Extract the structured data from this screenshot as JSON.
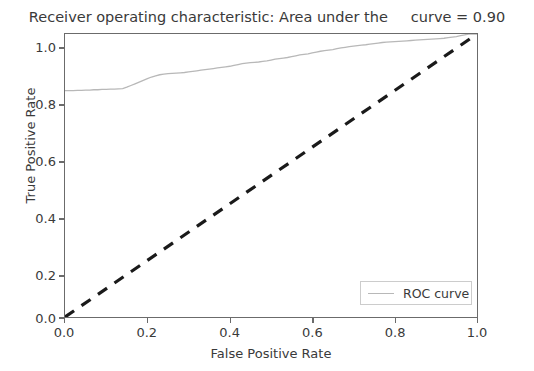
{
  "chart_data": {
    "type": "line",
    "title": "Receiver operating characteristic: Area under the     curve = 0.90",
    "xlabel": "False Positive Rate",
    "ylabel": "True Positive Rate",
    "xlim": [
      0.0,
      1.0
    ],
    "ylim": [
      0.0,
      1.0
    ],
    "grid": false,
    "legend_position": "lower right",
    "x_ticks": [
      "0.0",
      "0.2",
      "0.4",
      "0.6",
      "0.8",
      "1.0"
    ],
    "x_tick_values": [
      0.0,
      0.2,
      0.4,
      0.6,
      0.8,
      1.0
    ],
    "y_ticks": [
      "0.0",
      "0.2",
      "0.4",
      "0.6",
      "0.8",
      "1.0"
    ],
    "y_tick_values": [
      0.0,
      0.2,
      0.4,
      0.6,
      0.8,
      1.0
    ],
    "auc": 0.9,
    "series": [
      {
        "name": "ROC curve",
        "color": "#b8b8b8",
        "linestyle": "solid",
        "linewidth": 1.3,
        "points": [
          [
            0.0,
            0.8
          ],
          [
            0.01,
            0.8
          ],
          [
            0.02,
            0.8
          ],
          [
            0.03,
            0.801
          ],
          [
            0.04,
            0.801
          ],
          [
            0.05,
            0.802
          ],
          [
            0.06,
            0.802
          ],
          [
            0.07,
            0.803
          ],
          [
            0.08,
            0.803
          ],
          [
            0.09,
            0.804
          ],
          [
            0.1,
            0.804
          ],
          [
            0.11,
            0.805
          ],
          [
            0.12,
            0.805
          ],
          [
            0.13,
            0.806
          ],
          [
            0.14,
            0.807
          ],
          [
            0.15,
            0.812
          ],
          [
            0.16,
            0.818
          ],
          [
            0.17,
            0.824
          ],
          [
            0.18,
            0.83
          ],
          [
            0.19,
            0.836
          ],
          [
            0.2,
            0.842
          ],
          [
            0.21,
            0.848
          ],
          [
            0.22,
            0.852
          ],
          [
            0.23,
            0.856
          ],
          [
            0.24,
            0.858
          ],
          [
            0.25,
            0.86
          ],
          [
            0.26,
            0.861
          ],
          [
            0.27,
            0.862
          ],
          [
            0.28,
            0.863
          ],
          [
            0.29,
            0.864
          ],
          [
            0.3,
            0.866
          ],
          [
            0.31,
            0.868
          ],
          [
            0.32,
            0.87
          ],
          [
            0.33,
            0.872
          ],
          [
            0.34,
            0.874
          ],
          [
            0.35,
            0.876
          ],
          [
            0.36,
            0.878
          ],
          [
            0.37,
            0.88
          ],
          [
            0.38,
            0.882
          ],
          [
            0.39,
            0.884
          ],
          [
            0.4,
            0.886
          ],
          [
            0.41,
            0.889
          ],
          [
            0.42,
            0.892
          ],
          [
            0.43,
            0.895
          ],
          [
            0.44,
            0.897
          ],
          [
            0.45,
            0.899
          ],
          [
            0.46,
            0.9
          ],
          [
            0.47,
            0.901
          ],
          [
            0.48,
            0.903
          ],
          [
            0.49,
            0.905
          ],
          [
            0.5,
            0.908
          ],
          [
            0.51,
            0.911
          ],
          [
            0.52,
            0.913
          ],
          [
            0.53,
            0.915
          ],
          [
            0.54,
            0.917
          ],
          [
            0.55,
            0.92
          ],
          [
            0.56,
            0.923
          ],
          [
            0.57,
            0.926
          ],
          [
            0.58,
            0.928
          ],
          [
            0.59,
            0.93
          ],
          [
            0.6,
            0.933
          ],
          [
            0.61,
            0.936
          ],
          [
            0.62,
            0.939
          ],
          [
            0.63,
            0.941
          ],
          [
            0.64,
            0.943
          ],
          [
            0.65,
            0.945
          ],
          [
            0.66,
            0.948
          ],
          [
            0.67,
            0.951
          ],
          [
            0.68,
            0.953
          ],
          [
            0.69,
            0.955
          ],
          [
            0.7,
            0.957
          ],
          [
            0.71,
            0.959
          ],
          [
            0.72,
            0.961
          ],
          [
            0.73,
            0.962
          ],
          [
            0.74,
            0.964
          ],
          [
            0.75,
            0.966
          ],
          [
            0.76,
            0.968
          ],
          [
            0.77,
            0.97
          ],
          [
            0.78,
            0.971
          ],
          [
            0.79,
            0.972
          ],
          [
            0.8,
            0.973
          ],
          [
            0.81,
            0.974
          ],
          [
            0.82,
            0.975
          ],
          [
            0.83,
            0.976
          ],
          [
            0.84,
            0.977
          ],
          [
            0.85,
            0.978
          ],
          [
            0.86,
            0.979
          ],
          [
            0.87,
            0.98
          ],
          [
            0.88,
            0.981
          ],
          [
            0.89,
            0.982
          ],
          [
            0.9,
            0.983
          ],
          [
            0.91,
            0.984
          ],
          [
            0.92,
            0.985
          ],
          [
            0.93,
            0.987
          ],
          [
            0.94,
            0.989
          ],
          [
            0.95,
            0.991
          ],
          [
            0.96,
            0.994
          ],
          [
            0.97,
            0.997
          ],
          [
            0.98,
            1.0
          ],
          [
            0.99,
            1.0
          ],
          [
            1.0,
            1.0
          ]
        ]
      },
      {
        "name": "chance-diagonal",
        "color": "#1a1a1a",
        "linestyle": "dashed",
        "linewidth": 3.2,
        "points": [
          [
            0.0,
            0.0
          ],
          [
            1.0,
            1.0
          ]
        ]
      }
    ],
    "legend": [
      {
        "label": "ROC curve",
        "color": "#b8b8b8"
      }
    ]
  }
}
